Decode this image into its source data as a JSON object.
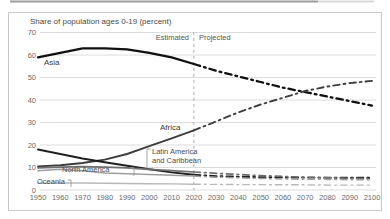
{
  "accent_colors": {
    "grid": "#dcdcdc",
    "card_border": "#c9c9c9",
    "divider": "#b0b0b0",
    "leader": "#9a9a9a",
    "top_strip_dark": "#9b9b9b",
    "top_strip_light": "#d8d8d8"
  },
  "chart_data": {
    "type": "line",
    "title": "Share of population ages 0-19 (percent)",
    "x": [
      1950,
      1960,
      1970,
      1980,
      1990,
      2000,
      2010,
      2020,
      2030,
      2040,
      2050,
      2060,
      2070,
      2080,
      2090,
      2100
    ],
    "x_tick_labels": [
      "1950",
      "1960",
      "1970",
      "1980",
      "1990",
      "2000",
      "2010",
      "2020",
      "2030",
      "2040",
      "2050",
      "2060",
      "2070",
      "2080",
      "2090",
      "2100"
    ],
    "y_ticks": [
      0,
      10,
      20,
      30,
      40,
      50,
      60,
      70
    ],
    "xlim": [
      1950,
      2100
    ],
    "ylim": [
      0,
      70
    ],
    "grid": "horizontal-only",
    "legend": "inline-labels",
    "divider": {
      "x": 2020,
      "style": "vertical-dashed",
      "left_label": "Estimated",
      "right_label": "Projected"
    },
    "line_style_note": "solid up to 2020 (estimated), dash-dot after 2020 (projected)",
    "series": [
      {
        "id": "asia",
        "name": "Asia",
        "label": "Asia",
        "label_visible": true,
        "color": "#101010",
        "width": 2.3,
        "values": [
          59,
          61,
          63,
          63,
          62.5,
          61,
          59,
          56,
          53,
          50.5,
          48,
          45.5,
          43.5,
          41.5,
          39.5,
          37.5
        ]
      },
      {
        "id": "africa",
        "name": "Africa",
        "label": "Africa",
        "label_visible": true,
        "color": "#3d3d3d",
        "width": 1.9,
        "values": [
          10.5,
          11,
          12,
          13.5,
          16,
          19.5,
          23,
          26.5,
          30.5,
          34.5,
          38,
          41,
          44,
          46,
          47.5,
          48.5
        ]
      },
      {
        "id": "unlabeled-region",
        "name": "",
        "label": "",
        "label_visible": false,
        "color": "#1f1f1f",
        "width": 1.9,
        "values": [
          18,
          16,
          14,
          12.3,
          10.8,
          9.2,
          7.8,
          6.8,
          6.2,
          5.9,
          5.7,
          5.6,
          5.5,
          5.5,
          5.4,
          5.4
        ]
      },
      {
        "id": "latin-america-caribbean",
        "name": "Latin America and Caribbean",
        "label_lines": [
          "Latin America",
          "and Caribbean"
        ],
        "label_visible": true,
        "color": "#6f6f6f",
        "width": 1.7,
        "values": [
          9.8,
          10.2,
          10.4,
          10.2,
          9.8,
          9.2,
          8.6,
          8,
          7.4,
          6.9,
          6.4,
          6,
          5.7,
          5.4,
          5.2,
          5
        ]
      },
      {
        "id": "north-america",
        "name": "North America",
        "label": "North America",
        "label_visible": true,
        "color": "#9e9e9e",
        "width": 1.5,
        "values": [
          8.6,
          9.2,
          8.6,
          7.6,
          7.2,
          6.9,
          6.6,
          6.2,
          5.7,
          5.4,
          5.1,
          4.9,
          4.8,
          4.7,
          4.6,
          4.5
        ]
      },
      {
        "id": "oceania",
        "name": "Oceania",
        "label": "Oceania",
        "label_visible": true,
        "color": "#b8b8b8",
        "width": 1.4,
        "values": [
          3,
          3.1,
          3.1,
          3,
          2.9,
          2.8,
          2.7,
          2.6,
          2.5,
          2.4,
          2.4,
          2.3,
          2.3,
          2.2,
          2.2,
          2.2
        ]
      }
    ]
  }
}
